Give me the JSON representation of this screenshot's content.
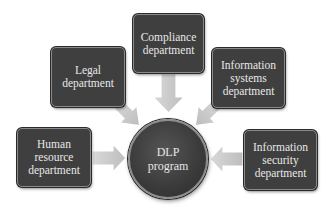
{
  "diagram": {
    "center": {
      "label_line1": "DLP",
      "label_line2": "program"
    },
    "nodes": [
      {
        "id": "compliance",
        "lines": [
          "Compliance",
          "department"
        ]
      },
      {
        "id": "legal",
        "lines": [
          "Legal",
          "department"
        ]
      },
      {
        "id": "information-systems",
        "lines": [
          "Information",
          "systems",
          "department"
        ]
      },
      {
        "id": "human-resource",
        "lines": [
          "Human",
          "resource",
          "department"
        ]
      },
      {
        "id": "information-security",
        "lines": [
          "Information",
          "security",
          "department"
        ]
      }
    ],
    "colors": {
      "node_fill": "#3f3f3f",
      "node_text": "#e8e8e8",
      "arrow_fill": "#c8c8c8",
      "background": "#ffffff"
    }
  }
}
